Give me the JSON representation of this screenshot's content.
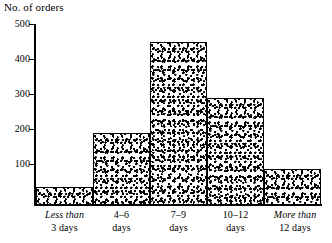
{
  "chart_data": {
    "type": "bar",
    "title": "",
    "subtitle": "",
    "xlabel": "",
    "ylabel": "No. of orders",
    "ylim": [
      0,
      500
    ],
    "grid": false,
    "legend": null,
    "categories": [
      "Less than 3 days",
      "4–6 days",
      "7–9 days",
      "10–12 days",
      "More than 12 days"
    ],
    "category_lines": [
      {
        "top": "Less than",
        "top_italic": true,
        "bottom": "3 days"
      },
      {
        "top": "4–6",
        "top_italic": false,
        "bottom": "days"
      },
      {
        "top": "7–9",
        "top_italic": false,
        "bottom": "days"
      },
      {
        "top": "10–12",
        "top_italic": false,
        "bottom": "days"
      },
      {
        "top": "More than",
        "top_italic": true,
        "bottom": "12 days"
      }
    ],
    "values": [
      50,
      200,
      450,
      295,
      100
    ],
    "ytick_labels": [
      "500",
      "400",
      "300",
      "200",
      "100"
    ],
    "ytick_values": [
      500,
      400,
      300,
      200,
      100
    ],
    "bar_fill": "#000000",
    "bar_fill_style": "mottled-stipple",
    "axis_color": "#000000",
    "background": "#ffffff"
  }
}
